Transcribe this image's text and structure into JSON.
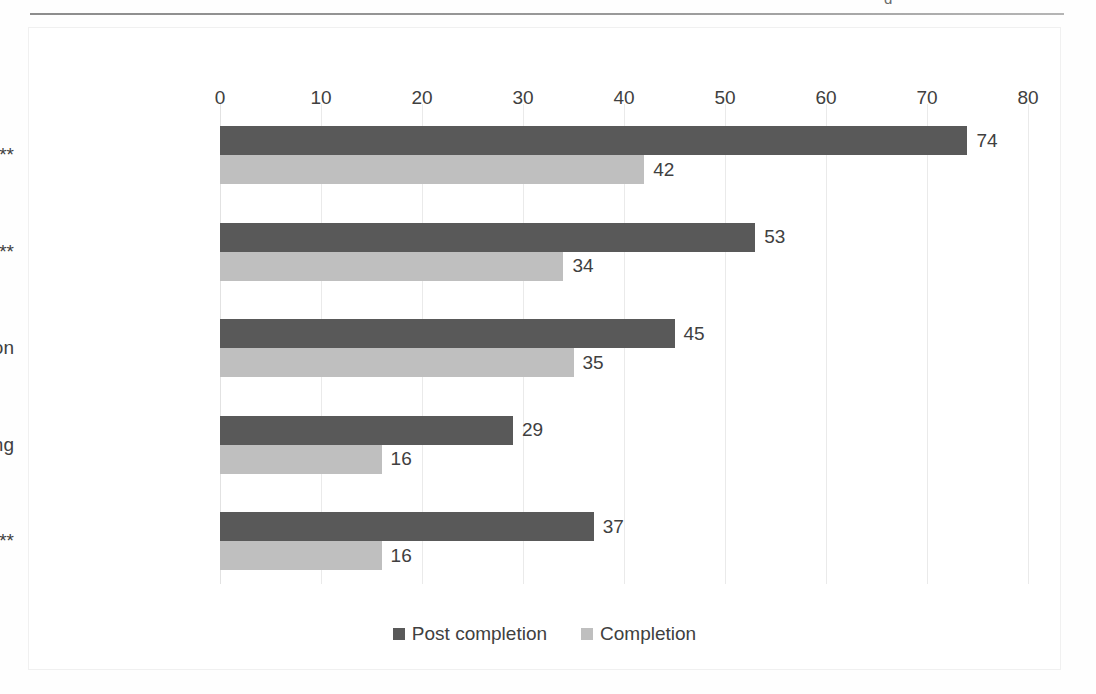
{
  "page": {
    "header_rule": true,
    "header_descender_glyph": "g"
  },
  "chart_data": {
    "type": "bar",
    "orientation": "horizontal",
    "title": "",
    "subtitle": "",
    "xlabel": "",
    "ylabel": "",
    "xlim": [
      0,
      80
    ],
    "xticks": [
      "0",
      "10",
      "20",
      "30",
      "40",
      "50",
      "60",
      "70",
      "80"
    ],
    "xtick_values": [
      0,
      10,
      20,
      30,
      40,
      50,
      60,
      70,
      80
    ],
    "grid": true,
    "grid_axis": "x",
    "legend_position": "bottom",
    "categories": [
      "Sustaining***",
      "Mainstreaming**",
      "Replication",
      "Upscaling",
      "Market Change**"
    ],
    "series": [
      {
        "name": "Post completion",
        "color": "#595959",
        "values": [
          74,
          53,
          45,
          29,
          37
        ],
        "labels": [
          "74",
          "53",
          "45",
          "29",
          "37"
        ]
      },
      {
        "name": "Completion",
        "color": "#bfbfbf",
        "values": [
          42,
          34,
          35,
          16,
          16
        ],
        "labels": [
          "42",
          "34",
          "35",
          "16",
          "16"
        ]
      }
    ]
  },
  "legend": {
    "items": [
      {
        "label": "Post completion",
        "color": "#595959",
        "swatch": "square-marker-icon"
      },
      {
        "label": "Completion",
        "color": "#bfbfbf",
        "swatch": "square-marker-icon"
      }
    ]
  },
  "colors": {
    "post_completion": "#595959",
    "completion": "#bfbfbf",
    "text": "#404040",
    "gridline": "#eaeaea",
    "chart_border": "#f0f0f0",
    "header_rule": "#8d8d8d",
    "background": "#ffffff"
  }
}
